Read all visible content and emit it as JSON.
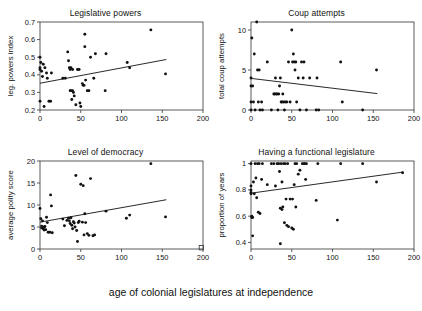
{
  "figure": {
    "shared_xlabel": "age of colonial legislatures at independence",
    "panel_count": 4
  },
  "chart_data": [
    {
      "type": "scatter",
      "title": "Legislative powers",
      "xlabel": "age of colonial legislatures at independence",
      "ylabel": "leg. powers index",
      "xlim": [
        0,
        200
      ],
      "ylim": [
        0.2,
        0.7
      ],
      "xticks": [
        0,
        50,
        100,
        150,
        200
      ],
      "yticks": [
        0.2,
        0.3,
        0.4,
        0.5,
        0.6,
        0.7
      ],
      "grid": false,
      "legend": "none",
      "trendline": {
        "x": [
          0,
          155
        ],
        "y": [
          0.352,
          0.487
        ],
        "direction": "positive"
      },
      "points": [
        [
          0,
          0.5
        ],
        [
          0,
          0.44
        ],
        [
          0,
          0.43
        ],
        [
          0,
          0.25
        ],
        [
          1,
          0.47
        ],
        [
          2,
          0.42
        ],
        [
          3,
          0.39
        ],
        [
          4,
          0.46
        ],
        [
          5,
          0.22
        ],
        [
          6,
          0.44
        ],
        [
          8,
          0.41
        ],
        [
          9,
          0.38
        ],
        [
          11,
          0.25
        ],
        [
          13,
          0.25
        ],
        [
          14,
          0.41
        ],
        [
          28,
          0.38
        ],
        [
          31,
          0.38
        ],
        [
          34,
          0.53
        ],
        [
          35,
          0.48
        ],
        [
          36,
          0.44
        ],
        [
          37,
          0.43
        ],
        [
          37,
          0.31
        ],
        [
          38,
          0.44
        ],
        [
          38,
          0.31
        ],
        [
          39,
          0.26
        ],
        [
          40,
          0.43
        ],
        [
          40,
          0.31
        ],
        [
          41,
          0.3
        ],
        [
          42,
          0.28
        ],
        [
          44,
          0.23
        ],
        [
          46,
          0.43
        ],
        [
          48,
          0.43
        ],
        [
          49,
          0.24
        ],
        [
          50,
          0.22
        ],
        [
          52,
          0.35
        ],
        [
          53,
          0.34
        ],
        [
          54,
          0.34
        ],
        [
          55,
          0.63
        ],
        [
          55,
          0.56
        ],
        [
          56,
          0.37
        ],
        [
          58,
          0.31
        ],
        [
          60,
          0.31
        ],
        [
          62,
          0.5
        ],
        [
          66,
          0.38
        ],
        [
          68,
          0.52
        ],
        [
          80,
          0.31
        ],
        [
          81,
          0.52
        ],
        [
          107,
          0.47
        ],
        [
          110,
          0.44
        ],
        [
          136,
          0.655
        ],
        [
          154,
          0.405
        ]
      ]
    },
    {
      "type": "scatter",
      "title": "Coup attempts",
      "xlabel": "age of colonial legislatures at independence",
      "ylabel": "total coup attempts",
      "xlim": [
        0,
        200
      ],
      "ylim": [
        0,
        11
      ],
      "xticks": [
        0,
        50,
        100,
        150,
        200
      ],
      "yticks": [
        0,
        5,
        10
      ],
      "grid": false,
      "legend": "none",
      "trendline": {
        "x": [
          0,
          155
        ],
        "y": [
          3.95,
          2.05
        ],
        "direction": "negative"
      },
      "points": [
        [
          0,
          4
        ],
        [
          0,
          3
        ],
        [
          0,
          1
        ],
        [
          0,
          0
        ],
        [
          1,
          9
        ],
        [
          2,
          3
        ],
        [
          3,
          1
        ],
        [
          4,
          7
        ],
        [
          5,
          0
        ],
        [
          7,
          11
        ],
        [
          8,
          5
        ],
        [
          9,
          1
        ],
        [
          10,
          5
        ],
        [
          11,
          0
        ],
        [
          13,
          1
        ],
        [
          14,
          0
        ],
        [
          20,
          6
        ],
        [
          25,
          0
        ],
        [
          28,
          2
        ],
        [
          29,
          2
        ],
        [
          30,
          4
        ],
        [
          31,
          2
        ],
        [
          32,
          2
        ],
        [
          33,
          0
        ],
        [
          34,
          2
        ],
        [
          35,
          3
        ],
        [
          36,
          4
        ],
        [
          37,
          1
        ],
        [
          38,
          1
        ],
        [
          39,
          2
        ],
        [
          40,
          1
        ],
        [
          41,
          0
        ],
        [
          42,
          1
        ],
        [
          44,
          1
        ],
        [
          46,
          6
        ],
        [
          48,
          1
        ],
        [
          50,
          10
        ],
        [
          51,
          6
        ],
        [
          52,
          7
        ],
        [
          53,
          6
        ],
        [
          54,
          5
        ],
        [
          55,
          6
        ],
        [
          56,
          1
        ],
        [
          58,
          4
        ],
        [
          60,
          0
        ],
        [
          62,
          6
        ],
        [
          64,
          4
        ],
        [
          65,
          6
        ],
        [
          68,
          0
        ],
        [
          72,
          4
        ],
        [
          80,
          0
        ],
        [
          81,
          4
        ],
        [
          83,
          0
        ],
        [
          110,
          6
        ],
        [
          112,
          1
        ],
        [
          137,
          0
        ],
        [
          154,
          5
        ]
      ]
    },
    {
      "type": "scatter",
      "title": "Level of democracy",
      "xlabel": "age of colonial legislatures at independence",
      "ylabel": "average polity score",
      "xlim": [
        0,
        200
      ],
      "ylim": [
        0,
        20
      ],
      "xticks": [
        0,
        50,
        100,
        150,
        200
      ],
      "yticks": [
        0,
        5,
        10,
        15,
        20
      ],
      "grid": false,
      "legend": "none",
      "trendline": {
        "x": [
          0,
          155
        ],
        "y": [
          6.1,
          11.2
        ],
        "direction": "positive"
      },
      "points": [
        [
          0,
          9.2
        ],
        [
          1,
          6.9
        ],
        [
          2,
          5.2
        ],
        [
          2,
          4.8
        ],
        [
          3,
          6.4
        ],
        [
          4,
          4.6
        ],
        [
          5,
          5.0
        ],
        [
          5,
          4.3
        ],
        [
          6,
          5.1
        ],
        [
          7,
          4.4
        ],
        [
          8,
          7.2
        ],
        [
          9,
          6.0
        ],
        [
          10,
          3.8
        ],
        [
          12,
          3.8
        ],
        [
          13,
          12.3
        ],
        [
          14,
          9.8
        ],
        [
          15,
          3.7
        ],
        [
          28,
          6.8
        ],
        [
          30,
          5.3
        ],
        [
          33,
          6.5
        ],
        [
          35,
          7.0
        ],
        [
          36,
          6.4
        ],
        [
          37,
          5.8
        ],
        [
          38,
          7.1
        ],
        [
          39,
          5.4
        ],
        [
          40,
          4.6
        ],
        [
          41,
          6.2
        ],
        [
          42,
          5.9
        ],
        [
          43,
          5.0
        ],
        [
          44,
          16.7
        ],
        [
          45,
          4.2
        ],
        [
          46,
          1.7
        ],
        [
          47,
          6.0
        ],
        [
          48,
          6.3
        ],
        [
          50,
          14.7
        ],
        [
          52,
          6.1
        ],
        [
          53,
          14.4
        ],
        [
          54,
          3.2
        ],
        [
          55,
          8.0
        ],
        [
          56,
          6.0
        ],
        [
          58,
          3.5
        ],
        [
          60,
          3.1
        ],
        [
          62,
          16.0
        ],
        [
          65,
          3.0
        ],
        [
          67,
          3.2
        ],
        [
          81,
          8.6
        ],
        [
          106,
          7.0
        ],
        [
          110,
          7.7
        ],
        [
          136,
          19.4
        ],
        [
          154,
          7.3
        ]
      ],
      "extra_markers": [
        {
          "x": 198,
          "y": 0.3,
          "shape": "open-square"
        }
      ]
    },
    {
      "type": "scatter",
      "title": "Having a functional legislature",
      "xlabel": "age of colonial legislatures at independence",
      "ylabel": "proportion of years",
      "xlim": [
        0,
        200
      ],
      "ylim": [
        0.35,
        1.02
      ],
      "xticks": [
        0,
        50,
        100,
        150,
        200
      ],
      "yticks": [
        0.4,
        0.6,
        0.8,
        1.0
      ],
      "ytick_labels": [
        "0.4",
        "0.6",
        "0.8",
        "1"
      ],
      "grid": false,
      "legend": "none",
      "trendline": {
        "x": [
          0,
          186
        ],
        "y": [
          0.775,
          0.935
        ],
        "direction": "positive"
      },
      "points": [
        [
          0,
          1.0
        ],
        [
          0,
          0.83
        ],
        [
          0,
          0.8
        ],
        [
          0,
          0.78
        ],
        [
          0,
          0.77
        ],
        [
          1,
          0.6
        ],
        [
          1,
          0.59
        ],
        [
          2,
          0.59
        ],
        [
          2,
          0.45
        ],
        [
          3,
          0.86
        ],
        [
          4,
          0.77
        ],
        [
          5,
          1.0
        ],
        [
          6,
          0.89
        ],
        [
          7,
          0.74
        ],
        [
          8,
          1.0
        ],
        [
          9,
          0.63
        ],
        [
          10,
          1.0
        ],
        [
          11,
          0.62
        ],
        [
          13,
          0.88
        ],
        [
          14,
          1.0
        ],
        [
          20,
          0.84
        ],
        [
          25,
          1.0
        ],
        [
          28,
          1.0
        ],
        [
          30,
          0.83
        ],
        [
          32,
          1.0
        ],
        [
          34,
          1.0
        ],
        [
          35,
          0.94
        ],
        [
          36,
          0.66
        ],
        [
          36,
          0.39
        ],
        [
          37,
          1.0
        ],
        [
          38,
          0.86
        ],
        [
          38,
          0.65
        ],
        [
          39,
          0.67
        ],
        [
          40,
          1.0
        ],
        [
          41,
          0.55
        ],
        [
          42,
          1.0
        ],
        [
          43,
          0.73
        ],
        [
          44,
          0.53
        ],
        [
          45,
          1.0
        ],
        [
          46,
          0.52
        ],
        [
          48,
          0.73
        ],
        [
          50,
          0.51
        ],
        [
          51,
          0.73
        ],
        [
          52,
          0.5
        ],
        [
          53,
          0.84
        ],
        [
          54,
          1.0
        ],
        [
          55,
          0.67
        ],
        [
          56,
          1.0
        ],
        [
          58,
          0.92
        ],
        [
          60,
          0.95
        ],
        [
          63,
          1.0
        ],
        [
          65,
          1.0
        ],
        [
          66,
          1.0
        ],
        [
          67,
          0.88
        ],
        [
          68,
          1.0
        ],
        [
          80,
          0.72
        ],
        [
          82,
          1.0
        ],
        [
          106,
          0.57
        ],
        [
          110,
          1.0
        ],
        [
          137,
          1.0
        ],
        [
          154,
          0.86
        ],
        [
          186,
          0.93
        ]
      ]
    }
  ]
}
